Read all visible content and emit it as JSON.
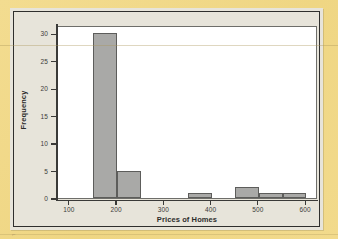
{
  "chart_data": {
    "type": "bar",
    "title": "",
    "xlabel": "Prices of Homes",
    "ylabel": "Frequency",
    "bin_width": 50,
    "x": [
      150,
      200,
      250,
      300,
      350,
      400,
      450,
      500,
      550
    ],
    "categories": [
      "150-200",
      "200-250",
      "250-300",
      "300-350",
      "350-400",
      "400-450",
      "450-500",
      "500-550",
      "550-600"
    ],
    "values": [
      30,
      5,
      0,
      0,
      1,
      0,
      2,
      1,
      1
    ],
    "xlim": [
      75,
      625
    ],
    "ylim": [
      0,
      31.5
    ],
    "xticks": [
      100,
      200,
      300,
      400,
      500,
      600
    ],
    "xtick_labels": [
      "100",
      "200",
      "300",
      "400",
      "500",
      "600"
    ],
    "yticks": [
      0,
      5,
      10,
      15,
      20,
      25,
      30
    ],
    "ytick_labels": [
      "0",
      "5",
      "10",
      "15",
      "20",
      "25",
      "30"
    ],
    "grid": false,
    "legend": false,
    "bar_color": "#a9a9a7",
    "bar_edge_color": "#5d5d5b",
    "panel_color": "#ffffff",
    "figure_color": "#e7e4da",
    "page_color": "#f2da8c",
    "axis_color": "#3a3a38"
  }
}
